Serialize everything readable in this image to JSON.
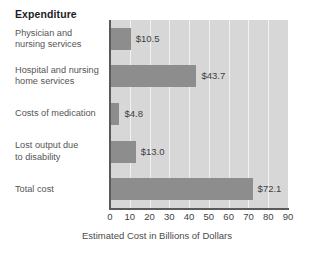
{
  "chart_data": {
    "type": "bar",
    "orientation": "horizontal",
    "title": "Expenditure",
    "xlabel": "Estimated Cost in Billions of Dollars",
    "ylabel": "",
    "xlim": [
      0,
      90
    ],
    "grid": true,
    "legend": "none",
    "categories": [
      "Physician and\nnursing services",
      "Hospital and nursing\nhome services",
      "Costs of medication",
      "Lost output due\nto disability",
      "Total cost"
    ],
    "values": [
      10.5,
      43.7,
      4.8,
      13.0,
      72.1
    ],
    "data_labels": [
      "$10.5",
      "$43.7",
      "$4.8",
      "$13.0",
      "$72.1"
    ],
    "xticks": [
      0,
      10,
      20,
      30,
      40,
      50,
      60,
      70,
      80,
      90
    ],
    "xtick_labels": [
      "0",
      "10",
      "20",
      "30",
      "40",
      "50",
      "60",
      "70",
      "80",
      "90"
    ],
    "colors": {
      "bar_fill": "#8d8d8d",
      "plot_background": "#d7d7d7",
      "gridline": "#f2f2f2",
      "axis_line": "#5a5a5a",
      "title_text": "#1d1d1d",
      "label_text": "#555555",
      "page_background": "#ffffff"
    }
  }
}
